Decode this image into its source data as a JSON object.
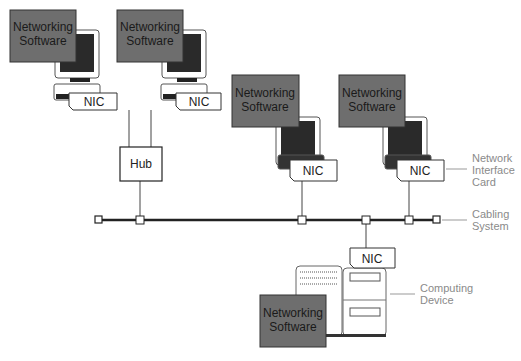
{
  "diagram": {
    "workstations": [
      {
        "software": [
          "Networking",
          "Software"
        ],
        "nic": "NIC"
      },
      {
        "software": [
          "Networking",
          "Software"
        ],
        "nic": "NIC"
      },
      {
        "software": [
          "Networking",
          "Software"
        ],
        "nic": "NIC"
      },
      {
        "software": [
          "Networking",
          "Software"
        ],
        "nic": "NIC"
      }
    ],
    "hub": {
      "label": "Hub"
    },
    "server": {
      "software": [
        "Networking",
        "Software"
      ],
      "nic": "NIC"
    },
    "callouts": {
      "nic": [
        "Network",
        "Interface",
        "Card"
      ],
      "cabling": [
        "Cabling",
        "System"
      ],
      "device": [
        "Computing",
        "Device"
      ]
    },
    "colors": {
      "software_box": "#6e6e6e",
      "line": "#333333",
      "callout": "#8a8a8a"
    }
  }
}
